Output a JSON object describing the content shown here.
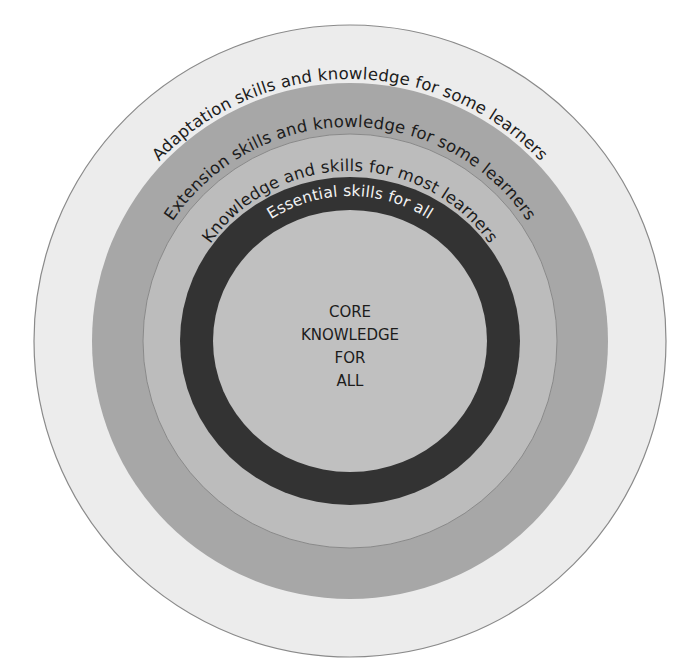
{
  "diagram": {
    "rings": [
      {
        "id": "adaptation",
        "label": "Adaptation skills and knowledge for some learners",
        "fill": "#ececec",
        "radius": 316
      },
      {
        "id": "extension",
        "label": "Extension skills and knowledge for some learners",
        "fill": "#a7a7a7",
        "radius": 258
      },
      {
        "id": "knowledge",
        "label": "Knowledge and skills for most learners",
        "fill": "#bcbcbc",
        "radius": 207
      },
      {
        "id": "essential",
        "label": "Essential skills for all",
        "fill": "#333333",
        "radius": 167
      }
    ],
    "core": {
      "lines": [
        "CORE",
        "KNOWLEDGE",
        "FOR",
        "ALL"
      ],
      "fill": "#c0c0c0",
      "radius": 134
    },
    "stroke_color": "#8a8a8a"
  }
}
